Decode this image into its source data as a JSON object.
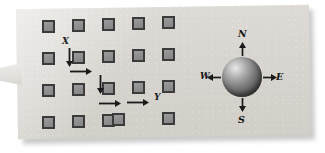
{
  "figure": {
    "background_color": "#ffffff",
    "card_color": "#d8d5d0"
  },
  "grid": {
    "columns": 5,
    "rows": 4,
    "node_fill": "#909090",
    "node_border": "#3b3b3b",
    "nodes": [
      {
        "id": "n-r1c1",
        "row": 1,
        "col": 1,
        "x": 42,
        "y": 20
      },
      {
        "id": "n-r1c2",
        "row": 1,
        "col": 2,
        "x": 72,
        "y": 19
      },
      {
        "id": "n-r1c3",
        "row": 1,
        "col": 3,
        "x": 102,
        "y": 18
      },
      {
        "id": "n-r1c4",
        "row": 1,
        "col": 4,
        "x": 132,
        "y": 17
      },
      {
        "id": "n-r1c5",
        "row": 1,
        "col": 5,
        "x": 162,
        "y": 16
      },
      {
        "id": "n-r2c1",
        "row": 2,
        "col": 1,
        "x": 42,
        "y": 52
      },
      {
        "id": "n-r2c2",
        "row": 2,
        "col": 2,
        "x": 72,
        "y": 51
      },
      {
        "id": "n-r2c3",
        "row": 2,
        "col": 3,
        "x": 102,
        "y": 50
      },
      {
        "id": "n-r2c4",
        "row": 2,
        "col": 4,
        "x": 132,
        "y": 49
      },
      {
        "id": "n-r2c5",
        "row": 2,
        "col": 5,
        "x": 162,
        "y": 48
      },
      {
        "id": "n-r3c1",
        "row": 3,
        "col": 1,
        "x": 42,
        "y": 84
      },
      {
        "id": "n-r3c2",
        "row": 3,
        "col": 2,
        "x": 72,
        "y": 83
      },
      {
        "id": "n-r3c3",
        "row": 3,
        "col": 3,
        "x": 102,
        "y": 82
      },
      {
        "id": "n-r3c4",
        "row": 3,
        "col": 4,
        "x": 132,
        "y": 81
      },
      {
        "id": "n-r3c5",
        "row": 3,
        "col": 5,
        "x": 162,
        "y": 80
      },
      {
        "id": "n-r4c1",
        "row": 4,
        "col": 1,
        "x": 42,
        "y": 116
      },
      {
        "id": "n-r4c2",
        "row": 4,
        "col": 2,
        "x": 72,
        "y": 115
      },
      {
        "id": "n-r4c3",
        "row": 4,
        "col": 3,
        "x": 102,
        "y": 114
      },
      {
        "id": "n-r4c4",
        "row": 4,
        "col": 4,
        "x": 112,
        "y": 113
      },
      {
        "id": "n-r4c5",
        "row": 4,
        "col": 5,
        "x": 162,
        "y": 112
      }
    ]
  },
  "path": {
    "start_label": "X",
    "end_label": "Y",
    "label_color": "#1d1d1d",
    "arrow_color": "#1a1a1a",
    "segments": [
      {
        "id": "seg-1",
        "direction": "down",
        "x": 65,
        "y": 48,
        "length": 19
      },
      {
        "id": "seg-2",
        "direction": "right",
        "x": 70,
        "y": 67,
        "length": 22
      },
      {
        "id": "seg-3",
        "direction": "down",
        "x": 96,
        "y": 75,
        "length": 19
      },
      {
        "id": "seg-4",
        "direction": "right",
        "x": 99,
        "y": 99,
        "length": 22
      },
      {
        "id": "seg-5",
        "direction": "right",
        "x": 127,
        "y": 98,
        "length": 22
      }
    ],
    "start_label_pos": {
      "x": 62,
      "y": 37
    },
    "end_label_pos": {
      "x": 154,
      "y": 93
    }
  },
  "compass": {
    "sphere": {
      "x": 222,
      "y": 57,
      "size": 40,
      "color": "#7e7e7e"
    },
    "center": {
      "x": 242,
      "y": 77
    },
    "arrow_color": "#1a1a1a",
    "directions": [
      {
        "id": "north",
        "label": "N",
        "heading": "up",
        "label_x": 238,
        "label_y": 29
      },
      {
        "id": "east",
        "label": "E",
        "heading": "right",
        "label_x": 276,
        "label_y": 72
      },
      {
        "id": "south",
        "label": "S",
        "heading": "down",
        "label_x": 238,
        "label_y": 115
      },
      {
        "id": "west",
        "label": "W",
        "heading": "left",
        "label_x": 200,
        "label_y": 72
      }
    ]
  }
}
